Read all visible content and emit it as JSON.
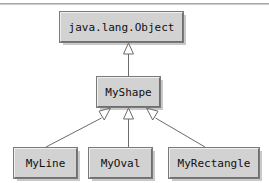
{
  "diagram": {
    "type": "uml-class-hierarchy",
    "relationship": "generalization",
    "background_color": "#ffffff",
    "box_fill_color": "#d2d2d2",
    "box_border_color": "#7a7a7a",
    "line_color": "#6b6b6b",
    "text_color": "#101010",
    "classes": [
      {
        "id": "object",
        "name": "java.lang.Object",
        "level": 0
      },
      {
        "id": "myshape",
        "name": "MyShape",
        "level": 1
      },
      {
        "id": "myline",
        "name": "MyLine",
        "level": 2
      },
      {
        "id": "myoval",
        "name": "MyOval",
        "level": 2
      },
      {
        "id": "myrect",
        "name": "MyRectangle",
        "level": 2
      }
    ],
    "edges": [
      {
        "from": "myshape",
        "to": "object",
        "kind": "extends"
      },
      {
        "from": "myline",
        "to": "myshape",
        "kind": "extends"
      },
      {
        "from": "myoval",
        "to": "myshape",
        "kind": "extends"
      },
      {
        "from": "myrect",
        "to": "myshape",
        "kind": "extends"
      }
    ]
  }
}
